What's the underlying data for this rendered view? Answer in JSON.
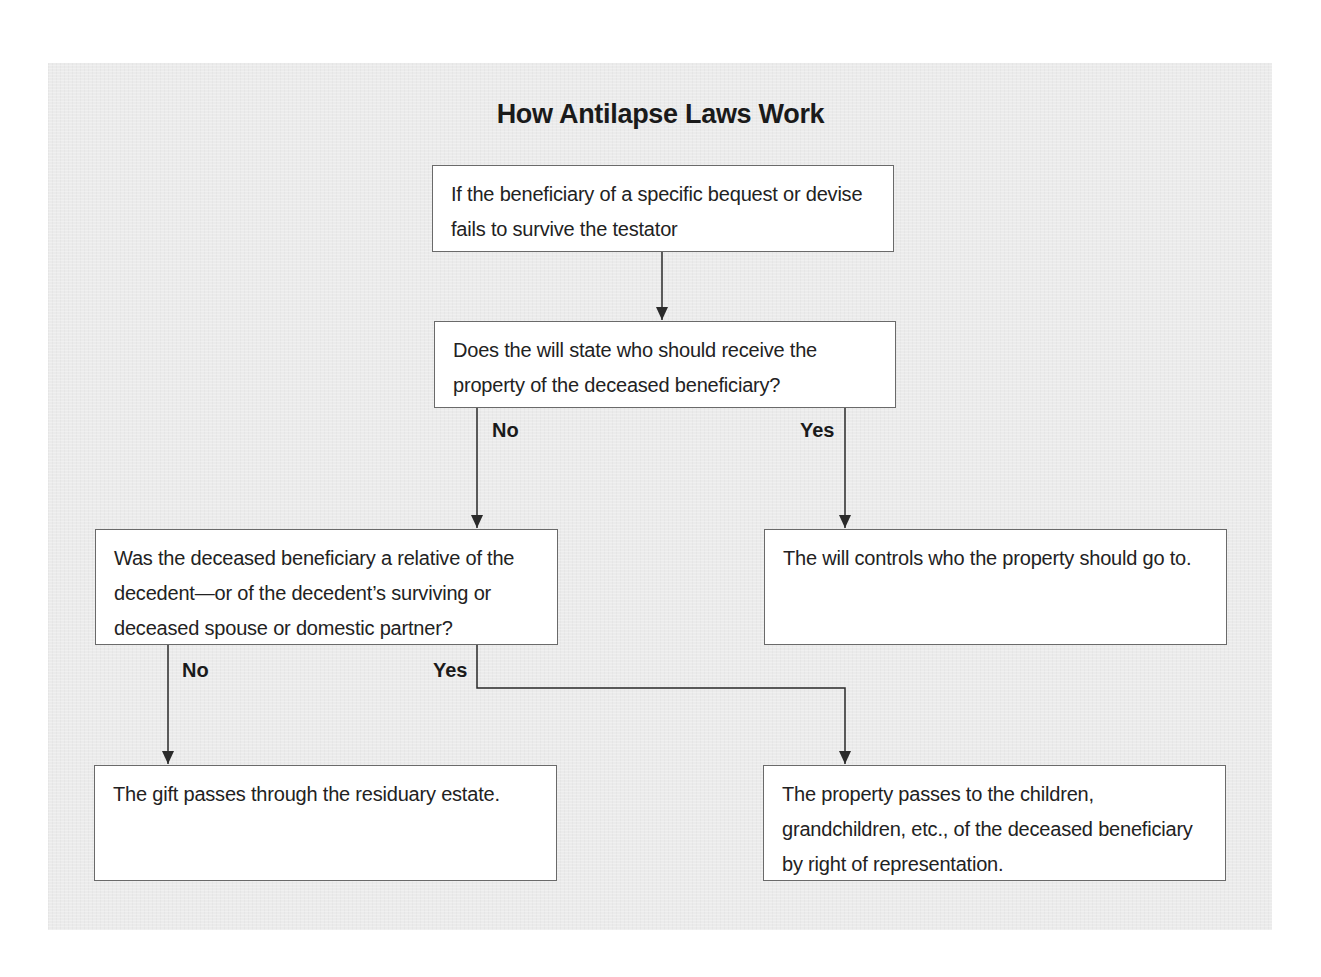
{
  "title": "How Antilapse Laws Work",
  "nodes": {
    "start": "If the beneficiary of a specific bequest or devise fails to survive the testator",
    "q1": "Does the will state who should receive the property of the deceased beneficiary?",
    "q2": "Was the deceased beneficiary a relative of the decedent—or of the decedent’s surviving or deceased spouse or domestic partner?",
    "will_controls": "The will controls who the property should go to.",
    "residuary": "The gift passes through the residuary estate.",
    "representation": "The property passes to the children, grandchildren, etc., of the deceased beneficiary by right of representation."
  },
  "edges": {
    "q1_no": "No",
    "q1_yes": "Yes",
    "q2_no": "No",
    "q2_yes": "Yes"
  },
  "colors": {
    "panel_bg": "#ebebeb",
    "box_bg": "#ffffff",
    "box_border": "#6a6a6a",
    "line": "#2a2a2a"
  }
}
